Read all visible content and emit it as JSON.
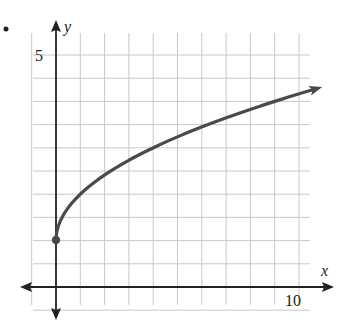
{
  "chart_data": {
    "type": "line",
    "title": "",
    "xlabel": "x",
    "ylabel": "y",
    "function": "y = sqrt(x) + 1",
    "x_tick_labels": [
      {
        "value": 10,
        "label": "10"
      }
    ],
    "y_tick_labels": [
      {
        "value": 5,
        "label": "5"
      }
    ],
    "grid": true,
    "x_grid_step": 1,
    "y_grid_step": 0.5,
    "xlim": [
      -1.3,
      11.4
    ],
    "ylim": [
      -0.6,
      5.4
    ],
    "start_point": {
      "x": 0,
      "y": 1,
      "closed": true
    },
    "end_arrow": true,
    "series": [
      {
        "name": "curve",
        "color": "#4a4a4a",
        "x": [
          0,
          0.25,
          0.5,
          1,
          2,
          3,
          4,
          5,
          6,
          7,
          8,
          9,
          10,
          10.8
        ],
        "y": [
          1,
          1.5,
          1.71,
          2,
          2.41,
          2.73,
          3,
          3.24,
          3.45,
          3.65,
          3.83,
          4,
          4.16,
          4.29
        ]
      }
    ]
  },
  "labels": {
    "x_axis": "x",
    "y_axis": "y",
    "y_tick_5": "5",
    "x_tick_10": "10",
    "bullet": "•"
  },
  "colors": {
    "grid": "#c8c8c8",
    "axis": "#222222",
    "curve": "#4a4a4a"
  }
}
